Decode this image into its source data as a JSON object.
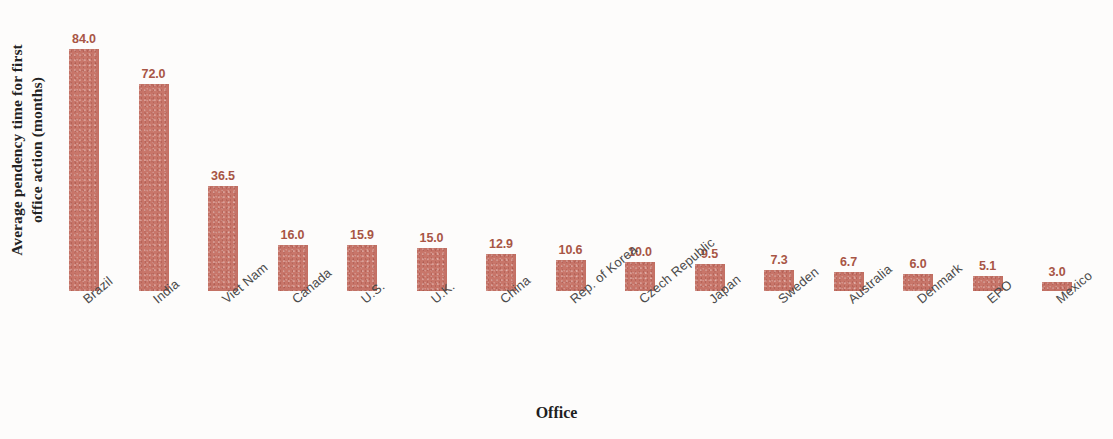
{
  "chart_data": {
    "type": "bar",
    "title": "",
    "xlabel": "Office",
    "ylabel": "Average pendency time for first office action (months)",
    "ylabel_line1": "Average pendency time for first",
    "ylabel_line2": "office action (months)",
    "categories": [
      "Brazil",
      "India",
      "Viet Nam",
      "Canada",
      "U.S.",
      "U.K.",
      "China",
      "Rep. of Korea",
      "Czech Republic",
      "Japan",
      "Sweden",
      "Australia",
      "Denmark",
      "EPO",
      "Mexico"
    ],
    "values": [
      84.0,
      72.0,
      36.5,
      16.0,
      15.9,
      15.0,
      12.9,
      10.6,
      10.0,
      9.5,
      7.3,
      6.7,
      6.0,
      5.1,
      3.0
    ],
    "value_labels": [
      "84.0",
      "72.0",
      "36.5",
      "16.0",
      "15.9",
      "15.0",
      "12.9",
      "10.6",
      "10.0",
      "9.5",
      "7.3",
      "6.7",
      "6.0",
      "5.1",
      "3.0"
    ],
    "ylim": [
      0,
      90
    ],
    "grid": false,
    "legend": false,
    "bar_color": "#c8766a",
    "value_label_color": "#a85545",
    "category_label_color": "#4a4a4a",
    "axis_title_color": "#232323",
    "background_color": "#fdfcfb"
  }
}
